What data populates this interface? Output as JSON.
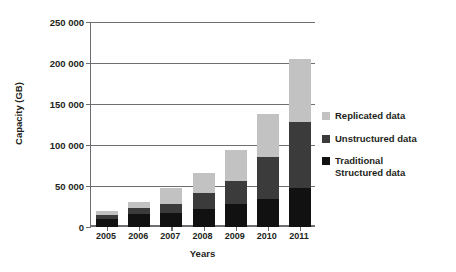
{
  "chart_data": {
    "type": "bar",
    "stacked": true,
    "title": "",
    "xlabel": "Years",
    "ylabel": "Capacity (GB)",
    "categories": [
      "2005",
      "2006",
      "2007",
      "2008",
      "2009",
      "2010",
      "2011"
    ],
    "ylim": [
      0,
      250000
    ],
    "yticks": [
      0,
      50000,
      100000,
      150000,
      200000,
      250000
    ],
    "ytick_labels": [
      "0",
      "50 000",
      "100 000",
      "150 000",
      "200 000",
      "250 000"
    ],
    "grid": true,
    "legend_position": "right",
    "series": [
      {
        "name": "Traditional\nStructured data",
        "color": "#111111",
        "values": [
          10000,
          16000,
          17000,
          22000,
          28000,
          34000,
          48000
        ]
      },
      {
        "name": "Unstructured data",
        "color": "#3b3b3b",
        "values": [
          5000,
          7000,
          11000,
          19000,
          28000,
          51000,
          80000
        ]
      },
      {
        "name": "Replicated data",
        "color": "#c2c2c2",
        "values": [
          5000,
          8000,
          19000,
          25000,
          38000,
          53000,
          77000
        ]
      }
    ],
    "totals": [
      20000,
      31000,
      47000,
      66000,
      94000,
      138000,
      205000
    ],
    "legend_order": [
      "Replicated data",
      "Unstructured data",
      "Traditional\nStructured data"
    ]
  },
  "colors": {
    "replicated": "#c2c2c2",
    "unstructured": "#3b3b3b",
    "traditional": "#111111",
    "axis": "#6d6e71",
    "text": "#231f20",
    "background": "#ffffff"
  }
}
